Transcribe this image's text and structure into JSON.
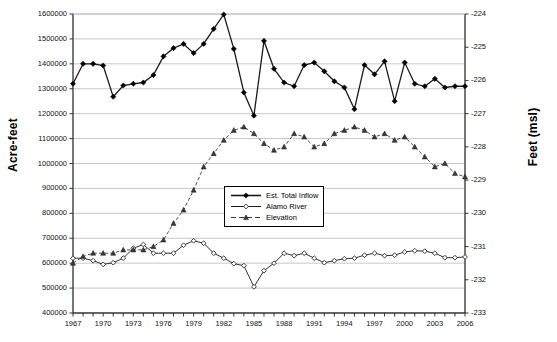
{
  "chart_data": {
    "type": "line",
    "title": "",
    "xlabel": "",
    "ylabel": "Acre-feet",
    "y2label": "Feet (msl)",
    "grid": true,
    "legend_position": "center",
    "x": [
      1967,
      1968,
      1969,
      1970,
      1971,
      1972,
      1973,
      1974,
      1975,
      1976,
      1977,
      1978,
      1979,
      1980,
      1981,
      1982,
      1983,
      1984,
      1985,
      1986,
      1987,
      1988,
      1989,
      1990,
      1991,
      1992,
      1993,
      1994,
      1995,
      1996,
      1997,
      1998,
      1999,
      2000,
      2001,
      2002,
      2003,
      2004,
      2005,
      2006
    ],
    "xtick_labels": [
      "1967",
      "1970",
      "1973",
      "1976",
      "1979",
      "1982",
      "1985",
      "1988",
      "1991",
      "1994",
      "1997",
      "2000",
      "2003",
      "2006"
    ],
    "xlim": [
      1967,
      2006
    ],
    "ylim": [
      400000,
      1600000
    ],
    "ytick_labels": [
      "400000",
      "500000",
      "600000",
      "700000",
      "800000",
      "900000",
      "1000000",
      "1100000",
      "1200000",
      "1300000",
      "1400000",
      "1500000",
      "1600000"
    ],
    "y2lim": [
      -233,
      -224
    ],
    "y2tick_labels": [
      "-233",
      "-232",
      "-231",
      "-230",
      "-229",
      "-228",
      "-227",
      "-226",
      "-225",
      "-224"
    ],
    "series": [
      {
        "name": "Est. Total Inflow",
        "axis": "left",
        "marker": "filled-diamond",
        "line": "solid",
        "values": [
          1320000,
          1400000,
          1400000,
          1393000,
          1268000,
          1313000,
          1320000,
          1325000,
          1355000,
          1430000,
          1463000,
          1480000,
          1443000,
          1480000,
          1540000,
          1598000,
          1460000,
          1285000,
          1192000,
          1492000,
          1380000,
          1325000,
          1310000,
          1395000,
          1405000,
          1370000,
          1330000,
          1305000,
          1218000,
          1395000,
          1358000,
          1410000,
          1250000,
          1405000,
          1320000,
          1310000,
          1340000,
          1305000,
          1310000,
          1310000
        ]
      },
      {
        "name": "Alamo River",
        "axis": "left",
        "marker": "open-diamond",
        "line": "solid",
        "values": [
          620000,
          620000,
          610000,
          595000,
          602000,
          620000,
          660000,
          675000,
          640000,
          640000,
          640000,
          672000,
          690000,
          680000,
          640000,
          620000,
          598000,
          590000,
          505000,
          570000,
          600000,
          640000,
          630000,
          640000,
          620000,
          602000,
          610000,
          618000,
          620000,
          632000,
          640000,
          630000,
          632000,
          645000,
          650000,
          648000,
          640000,
          622000,
          622000,
          625000
        ]
      },
      {
        "name": "Elevation",
        "axis": "right",
        "marker": "triangle",
        "line": "dashed",
        "values": [
          -231.5,
          -231.3,
          -231.2,
          -231.2,
          -231.2,
          -231.1,
          -231.1,
          -231.1,
          -231.0,
          -230.8,
          -230.3,
          -229.9,
          -229.3,
          -228.6,
          -228.2,
          -227.8,
          -227.5,
          -227.4,
          -227.6,
          -227.9,
          -228.1,
          -228.0,
          -227.6,
          -227.7,
          -228.0,
          -227.9,
          -227.6,
          -227.5,
          -227.4,
          -227.5,
          -227.7,
          -227.6,
          -227.8,
          -227.7,
          -228.0,
          -228.3,
          -228.6,
          -228.5,
          -228.8,
          -228.9
        ]
      }
    ]
  },
  "legend": {
    "items": [
      {
        "label": "Est. Total Inflow"
      },
      {
        "label": "Alamo River"
      },
      {
        "label": "Elevation"
      }
    ]
  }
}
